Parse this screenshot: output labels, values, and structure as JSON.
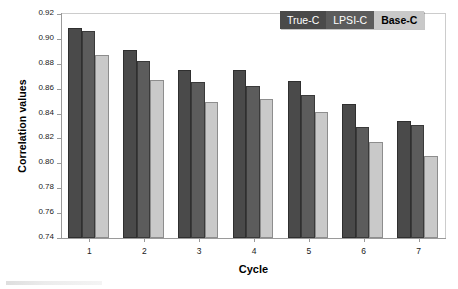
{
  "chart_data": {
    "type": "bar",
    "title": "",
    "subtitle": "",
    "xlabel": "Cycle",
    "ylabel": "Correlation values",
    "categories": [
      "1",
      "2",
      "3",
      "4",
      "5",
      "6",
      "7"
    ],
    "series": [
      {
        "name": "True-C",
        "color": "#4a4a4a",
        "values": [
          0.909,
          0.891,
          0.875,
          0.875,
          0.866,
          0.848,
          0.834
        ]
      },
      {
        "name": "LPSI-C",
        "color": "#5c5c5c",
        "values": [
          0.906,
          0.882,
          0.865,
          0.862,
          0.855,
          0.829,
          0.831
        ]
      },
      {
        "name": "Base-C",
        "color": "#c9c9c9",
        "values": [
          0.887,
          0.867,
          0.849,
          0.852,
          0.841,
          0.817,
          0.806
        ]
      }
    ],
    "ylim": [
      0.74,
      0.92
    ],
    "yticks": [
      "0.92",
      "0.90",
      "0.88",
      "0.86",
      "0.84",
      "0.82",
      "0.80",
      "0.78",
      "0.76",
      "0.74"
    ],
    "ytick_values": [
      0.92,
      0.9,
      0.88,
      0.86,
      0.84,
      0.82,
      0.8,
      0.78,
      0.76,
      0.74
    ],
    "grid": false,
    "legend_position": "top-right"
  },
  "legend": {
    "items": [
      {
        "label": "True-C",
        "class": "k0"
      },
      {
        "label": "LPSI-C",
        "class": "k1"
      },
      {
        "label": "Base-C",
        "class": "k2"
      }
    ]
  }
}
